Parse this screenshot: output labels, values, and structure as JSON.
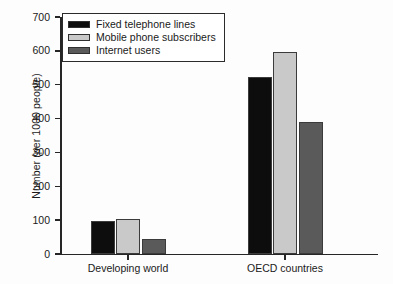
{
  "chart_data": {
    "type": "bar",
    "title": "",
    "xlabel": "",
    "ylabel": "Number (per 1000 people)",
    "categories": [
      "Developing world",
      "OECD countries"
    ],
    "series": [
      {
        "name": "Fixed telephone lines",
        "color": "#0d0d0d",
        "values": [
          97,
          522
        ]
      },
      {
        "name": "Mobile phone subscribers",
        "color": "#c9c9c9",
        "values": [
          104,
          596
        ]
      },
      {
        "name": "Internet users",
        "color": "#5a5a5a",
        "values": [
          44,
          391
        ]
      }
    ],
    "ylim": [
      0,
      700
    ],
    "yticks": [
      0,
      100,
      200,
      300,
      400,
      500,
      600,
      700
    ],
    "ytick_labels": [
      "0",
      "100",
      "200",
      "300",
      "400",
      "500",
      "600",
      "700"
    ],
    "grid": false,
    "legend_position": "top-left"
  },
  "legend": {
    "entries": [
      {
        "label": "Fixed telephone lines"
      },
      {
        "label": "Mobile phone subscribers"
      },
      {
        "label": "Internet users"
      }
    ]
  },
  "axes": {
    "y_label": "Number (per 1000 people)",
    "y_tick_labels": [
      "700",
      "600",
      "500",
      "400",
      "300",
      "200",
      "100",
      "0"
    ],
    "x_tick_labels": [
      "Developing world",
      "OECD countries"
    ]
  }
}
